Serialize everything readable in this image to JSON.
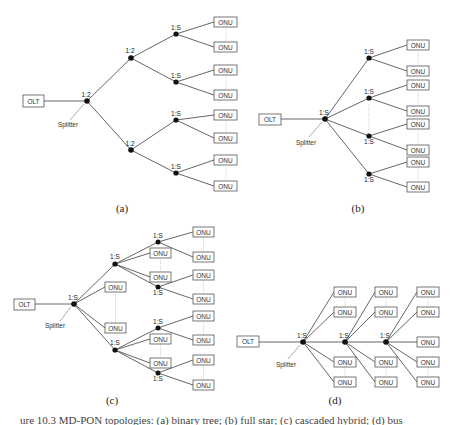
{
  "labels": {
    "olt": "OLT",
    "onu": "ONU",
    "splitter": "Splitter",
    "ratio_2": "1:2",
    "ratio_s": "1:S"
  },
  "subfigures": [
    {
      "id": "a",
      "caption": "(a)",
      "topology": "tree of 1:2 splitters feeding 1:S splitters",
      "stages": [
        "1:2",
        "1:2",
        "1:S"
      ],
      "onu_count_shown": 8
    },
    {
      "id": "b",
      "caption": "(b)",
      "topology": "single 1:S splitter feeding four 1:S splitters",
      "stages": [
        "1:S",
        "1:S"
      ],
      "onu_count_shown": 8
    },
    {
      "id": "c",
      "caption": "(c)",
      "topology": "1:S splitter with direct ONUs and cascaded 1:S splitters",
      "stages": [
        "1:S",
        "1:S",
        "1:S"
      ],
      "onu_count_shown": 16
    },
    {
      "id": "d",
      "caption": "(d)",
      "topology": "bus of cascaded 1:S splitters along a trunk",
      "stages": [
        "1:S",
        "1:S",
        "1:S"
      ],
      "onu_count_shown": 13
    }
  ],
  "caption_a": "(a)",
  "caption_b": "(b)",
  "caption_c": "(c)",
  "caption_d": "(d)",
  "bottom_caption": "ure 10.3 MD-PON topologies: (a) binary tree; (b) full star; (c) cascaded hybrid; (d) bus"
}
